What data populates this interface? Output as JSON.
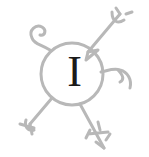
{
  "illustration": {
    "letter": "I",
    "description": "decorative drop-cap emblem: circle with sprawling limbs",
    "colors": {
      "stroke": "#b8b8b8",
      "letter": "#1a1a1a",
      "background": "#ffffff"
    }
  }
}
